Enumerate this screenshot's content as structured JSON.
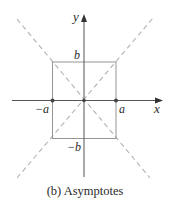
{
  "diagram": {
    "caption": "(b) Asymptotes",
    "axes": {
      "x_label": "x",
      "y_label": "y"
    },
    "labels": {
      "b_top": "b",
      "b_bottom": "−b",
      "a_right": "a",
      "a_left": "−a"
    },
    "elements": [
      "x-axis with arrow",
      "y-axis with arrow",
      "central rectangle from (−a,−b) to (a,b)",
      "dashed asymptote y = (b/a)x",
      "dashed asymptote y = −(b/a)x",
      "points at (−a,0), (0,0), (a,0)"
    ],
    "colors": {
      "axis": "#555555",
      "box": "#8a8a8a",
      "asymptote": "#b0b0b0",
      "point": "#444444",
      "text": "#2a2a2a"
    }
  }
}
